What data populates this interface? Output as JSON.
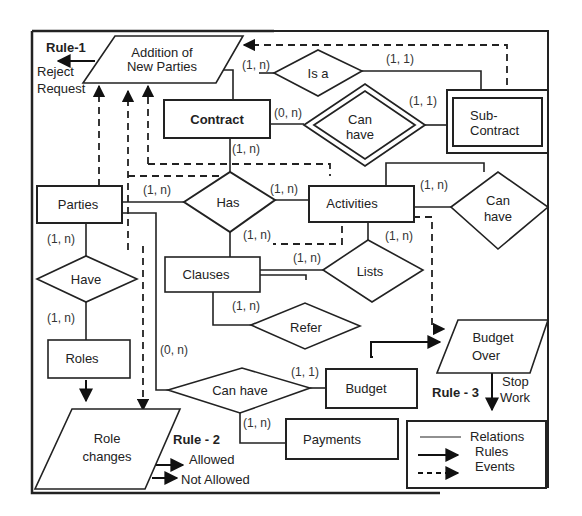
{
  "entities": {
    "contract": "Contract",
    "sub_contract_l1": "Sub-",
    "sub_contract_l2": "Contract",
    "parties": "Parties",
    "activities": "Activities",
    "clauses": "Clauses",
    "roles": "Roles",
    "budget": "Budget",
    "payments": "Payments"
  },
  "relationships": {
    "is_a": "Is a",
    "can_have_sub_l1": "Can",
    "can_have_sub_l2": "have",
    "has": "Has",
    "can_have_act_l1": "Can",
    "can_have_act_l2": "have",
    "have": "Have",
    "lists": "Lists",
    "refer": "Refer",
    "can_have_budget": "Can have"
  },
  "events": {
    "addition_l1": "Addition   of",
    "addition_l2": "New Parties",
    "budget_over_l1": "Budget",
    "budget_over_l2": "Over",
    "role_changes_l1": "Role",
    "role_changes_l2": "changes"
  },
  "rules": {
    "rule1": "Rule-1",
    "rule1_outcome_l1": "Reject",
    "rule1_outcome_l2": "Request",
    "rule2": "Rule - 2",
    "rule2_allowed": "Allowed",
    "rule2_not_allowed": "Not Allowed",
    "rule3": "Rule - 3",
    "rule3_outcome_l1": "Stop",
    "rule3_outcome_l2": "Work"
  },
  "cardinalities": {
    "addition_isa": "(1, n)",
    "isa_sub": "(1, 1)",
    "contract_canhave": "(0, n)",
    "canhave_sub": "(1, 1)",
    "contract_has": "(1, n)",
    "parties_has": "(1, n)",
    "has_activities": "(1, n)",
    "has_clauses": "(1, n)",
    "activities_canhave": "(1, n)",
    "activities_lists": "(1, n)",
    "clauses_lists": "(1, n)",
    "clauses_refer": "(1, n)",
    "parties_have": "(1, n)",
    "have_roles": "(1, n)",
    "parties_canhave_budget": "(0, n)",
    "canhave_budget": "(1, 1)",
    "canhave_payments": "(1, n)"
  },
  "legend": {
    "relations": "Relations",
    "rules": "Rules",
    "events": "Events"
  }
}
